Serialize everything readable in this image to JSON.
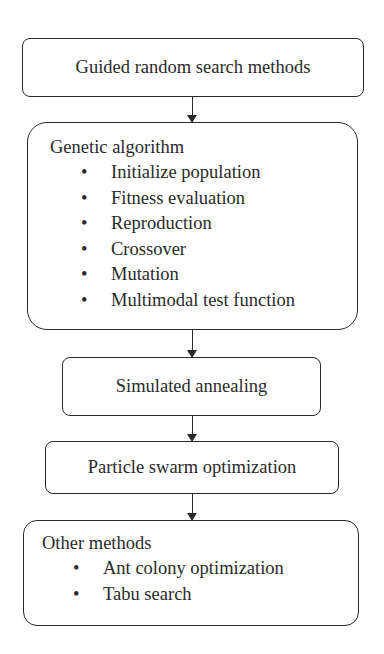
{
  "diagram": {
    "type": "flowchart",
    "nodes": [
      {
        "id": "guided",
        "label": "Guided random search methods"
      },
      {
        "id": "ga",
        "title": "Genetic algorithm",
        "items": [
          "Initialize population",
          "Fitness evaluation",
          "Reproduction",
          "Crossover",
          "Mutation",
          "Multimodal test function"
        ]
      },
      {
        "id": "sa",
        "label": "Simulated annealing"
      },
      {
        "id": "pso",
        "label": "Particle swarm optimization"
      },
      {
        "id": "other",
        "title": "Other methods",
        "items": [
          "Ant colony optimization",
          "Tabu search"
        ]
      }
    ],
    "edges": [
      {
        "from": "guided",
        "to": "ga"
      },
      {
        "from": "ga",
        "to": "sa"
      },
      {
        "from": "sa",
        "to": "pso"
      },
      {
        "from": "pso",
        "to": "other"
      }
    ],
    "bullet": "•",
    "colors": {
      "line": "#2a2a2a",
      "background": "#ffffff"
    }
  }
}
